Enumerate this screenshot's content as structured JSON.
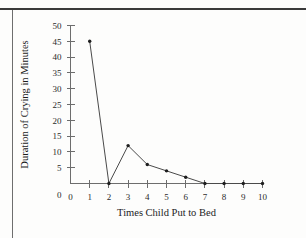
{
  "chart_data": {
    "type": "line",
    "title": "",
    "xlabel": "Times Child Put to Bed",
    "ylabel": "Duration of Crying in Minutes",
    "x": [
      1,
      2,
      3,
      4,
      5,
      6,
      7,
      8,
      9,
      10
    ],
    "values": [
      45,
      0,
      12,
      6,
      4,
      2,
      0,
      0,
      0,
      0
    ],
    "series": [
      {
        "name": "Duration of Crying in Minutes",
        "values": [
          45,
          0,
          12,
          6,
          4,
          2,
          0,
          0,
          0,
          0
        ]
      }
    ],
    "xlim": [
      0,
      10
    ],
    "ylim": [
      0,
      50
    ],
    "xticks": [
      0,
      1,
      2,
      3,
      4,
      5,
      6,
      7,
      8,
      9,
      10
    ],
    "yticks": [
      0,
      5,
      10,
      15,
      20,
      25,
      30,
      35,
      40,
      45,
      50
    ],
    "xtick_labels": [
      "0",
      "1",
      "2",
      "3",
      "4",
      "5",
      "6",
      "7",
      "8",
      "9",
      "10"
    ],
    "ytick_labels": [
      "0",
      "5",
      "10",
      "15",
      "20",
      "25",
      "30",
      "35",
      "40",
      "45",
      "50"
    ],
    "grid": false,
    "legend": false,
    "markers": true,
    "marker_style": "dot",
    "line_color": "#4a4a4a",
    "marker_color": "#1e1e1e",
    "axis_color": "#6d6d6d",
    "background_color": "#fdfdfc"
  }
}
